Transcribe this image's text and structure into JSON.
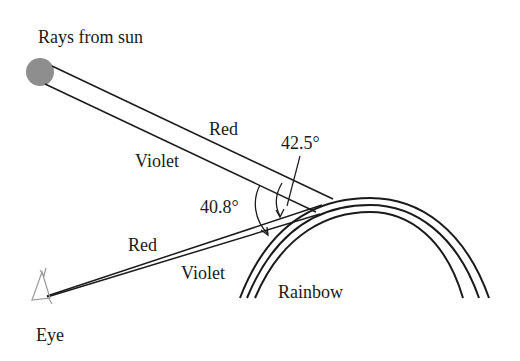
{
  "diagram": {
    "title_label": "Rays from sun",
    "incoming": {
      "red_label": "Red",
      "violet_label": "Violet"
    },
    "outgoing": {
      "red_label": "Red",
      "violet_label": "Violet"
    },
    "angles": {
      "red_angle": "42.5°",
      "violet_angle": "40.8°"
    },
    "rainbow_label": "Rainbow",
    "eye_label": "Eye",
    "colors": {
      "sun": "#8e8e8e",
      "lines": "#1a1a1a",
      "eye": "#9a9a9a"
    }
  }
}
